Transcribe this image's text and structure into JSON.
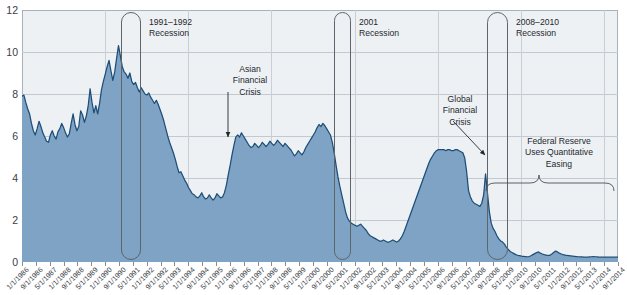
{
  "chart_data": {
    "type": "area",
    "title": "",
    "xlabel": "",
    "ylabel": "",
    "ylim": [
      0,
      12
    ],
    "yticks": [
      0,
      2,
      4,
      6,
      8,
      10,
      12
    ],
    "grid": true,
    "legend": "none",
    "series_name": "3-Month Interest Rate (percent)",
    "x_tick_labels": [
      "1/1/1986",
      "9/1/1986",
      "5/1/1987",
      "1/1/1988",
      "9/1/1988",
      "5/1/1989",
      "1/1/1990",
      "9/1/1990",
      "5/1/1991",
      "1/1/1992",
      "9/1/1992",
      "5/1/1993",
      "1/1/1994",
      "9/1/1994",
      "5/1/1995",
      "1/1/1996",
      "9/1/1996",
      "5/1/1997",
      "1/1/1998",
      "9/1/1998",
      "5/1/1999",
      "1/1/2000",
      "9/1/2000",
      "5/1/2001",
      "1/1/2002",
      "9/1/2002",
      "5/1/2003",
      "1/1/2004",
      "9/1/2004",
      "5/1/2005",
      "1/1/2006",
      "9/1/2006",
      "5/1/2007",
      "1/1/2008",
      "9/1/2008",
      "5/1/2009",
      "1/1/2010",
      "9/1/2010",
      "5/1/2011",
      "1/1/2012",
      "9/1/2012",
      "5/1/2013",
      "1/1/2014",
      "9/1/2014"
    ],
    "x_start": "1/1/1986",
    "x_end": "9/1/2014",
    "values": [
      7.9,
      7.95,
      7.6,
      7.3,
      7.05,
      6.6,
      6.25,
      6.05,
      6.35,
      6.7,
      6.45,
      6.15,
      5.95,
      5.75,
      5.7,
      6.05,
      6.25,
      6.0,
      5.85,
      6.2,
      6.35,
      6.6,
      6.4,
      6.15,
      5.95,
      6.1,
      6.6,
      7.05,
      6.55,
      6.25,
      6.45,
      7.2,
      7.0,
      6.65,
      6.95,
      7.45,
      8.25,
      7.6,
      7.1,
      7.45,
      7.05,
      7.55,
      8.2,
      8.6,
      8.95,
      9.3,
      9.6,
      9.1,
      8.65,
      9.05,
      9.7,
      10.3,
      9.8,
      9.3,
      9.05,
      8.95,
      8.75,
      9.0,
      8.6,
      8.45,
      8.55,
      8.3,
      8.1,
      8.3,
      8.15,
      8.0,
      7.95,
      8.05,
      7.85,
      7.7,
      7.55,
      7.7,
      7.5,
      7.25,
      7.0,
      6.7,
      6.35,
      6.0,
      5.7,
      5.45,
      5.2,
      4.9,
      4.55,
      4.25,
      4.3,
      4.1,
      3.9,
      3.75,
      3.55,
      3.4,
      3.25,
      3.2,
      3.1,
      3.05,
      3.15,
      3.3,
      3.1,
      3.0,
      3.05,
      3.2,
      3.05,
      2.95,
      3.05,
      3.25,
      3.15,
      3.05,
      3.1,
      3.3,
      3.65,
      4.15,
      4.6,
      5.1,
      5.55,
      5.95,
      6.05,
      5.95,
      6.15,
      6.0,
      5.85,
      5.7,
      5.55,
      5.45,
      5.5,
      5.65,
      5.55,
      5.45,
      5.55,
      5.7,
      5.6,
      5.5,
      5.6,
      5.75,
      5.65,
      5.55,
      5.65,
      5.8,
      5.7,
      5.6,
      5.5,
      5.65,
      5.55,
      5.45,
      5.35,
      5.2,
      5.05,
      5.15,
      5.3,
      5.2,
      5.1,
      5.25,
      5.45,
      5.6,
      5.75,
      5.9,
      6.05,
      6.2,
      6.4,
      6.55,
      6.45,
      6.6,
      6.5,
      6.35,
      6.2,
      6.05,
      5.7,
      5.2,
      4.6,
      4.05,
      3.6,
      3.2,
      2.8,
      2.4,
      2.1,
      1.95,
      1.85,
      1.8,
      1.75,
      1.7,
      1.75,
      1.8,
      1.7,
      1.6,
      1.5,
      1.35,
      1.25,
      1.2,
      1.15,
      1.1,
      1.05,
      1.0,
      1.0,
      1.05,
      1.0,
      0.95,
      0.95,
      1.0,
      1.05,
      1.0,
      0.95,
      1.0,
      1.1,
      1.25,
      1.45,
      1.7,
      1.95,
      2.2,
      2.45,
      2.7,
      2.95,
      3.2,
      3.45,
      3.7,
      3.95,
      4.2,
      4.45,
      4.7,
      4.9,
      5.05,
      5.2,
      5.3,
      5.35,
      5.35,
      5.35,
      5.35,
      5.3,
      5.35,
      5.35,
      5.3,
      5.3,
      5.35,
      5.35,
      5.3,
      5.25,
      5.2,
      4.95,
      4.3,
      3.4,
      3.1,
      2.9,
      2.8,
      2.75,
      2.7,
      2.65,
      2.8,
      3.2,
      4.2,
      3.3,
      2.4,
      1.85,
      1.6,
      1.45,
      1.25,
      1.1,
      1.0,
      0.95,
      0.85,
      0.7,
      0.6,
      0.5,
      0.45,
      0.4,
      0.35,
      0.32,
      0.3,
      0.28,
      0.27,
      0.26,
      0.25,
      0.26,
      0.3,
      0.35,
      0.4,
      0.45,
      0.48,
      0.42,
      0.38,
      0.35,
      0.33,
      0.31,
      0.32,
      0.38,
      0.45,
      0.52,
      0.48,
      0.42,
      0.38,
      0.35,
      0.33,
      0.31,
      0.3,
      0.29,
      0.28,
      0.27,
      0.26,
      0.25,
      0.24,
      0.24,
      0.23,
      0.23,
      0.23,
      0.24,
      0.25,
      0.26,
      0.25,
      0.24,
      0.23,
      0.23,
      0.23,
      0.23,
      0.23,
      0.23,
      0.23,
      0.23,
      0.23,
      0.23,
      0.23
    ],
    "colors": {
      "area_fill": "#7fa3c4",
      "line": "#1d4e77",
      "plot_background": "#eef1f4",
      "gridline": "#c2c9d0",
      "axis_text": "#3a4046",
      "annotation_text": "#23282c",
      "recession_outline": "#5c646c"
    },
    "annotations": [
      {
        "name": "asian-financial-crisis",
        "lines": [
          "Asian",
          "Financial",
          "Crisis"
        ],
        "text": "Asian Financial Crisis"
      },
      {
        "name": "global-financial-crisis",
        "lines": [
          "Global",
          "Financial",
          "Crisis"
        ],
        "text": "Global Financial Crisis"
      },
      {
        "name": "quantitative-easing",
        "lines": [
          "Federal Reserve",
          "Uses Quantitative",
          "Easing"
        ],
        "text": "Federal Reserve Uses Quantitative Easing"
      }
    ],
    "recessions": [
      {
        "name": "recession-1991-1992",
        "label_line1": "1991–1992",
        "label_line2": "Recession",
        "start": "7/1/1990",
        "end": "3/1/1991"
      },
      {
        "name": "recession-2001",
        "label_line1": "2001",
        "label_line2": "Recession",
        "start": "3/1/2001",
        "end": "11/1/2001"
      },
      {
        "name": "recession-2008-2010",
        "label_line1": "2008–2010",
        "label_line2": "Recession",
        "start": "12/1/2007",
        "end": "6/1/2009"
      }
    ]
  }
}
